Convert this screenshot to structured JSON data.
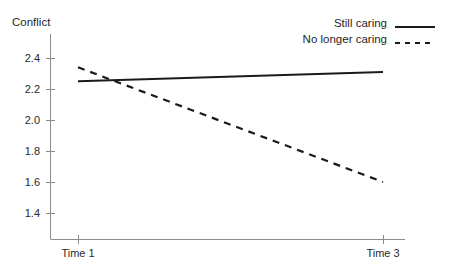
{
  "chart_data": {
    "type": "line",
    "title": "",
    "ylabel": "Conflict",
    "xlabel": "",
    "categories": [
      "Time 1",
      "Time 3"
    ],
    "x": [
      1,
      3
    ],
    "ylim": [
      1.3,
      2.48
    ],
    "xlim": [
      0.72,
      3.15
    ],
    "yticks": [
      "2.4",
      "2.2",
      "2.0",
      "1.8",
      "1.6",
      "1.4"
    ],
    "ytick_values": [
      2.4,
      2.2,
      2.0,
      1.8,
      1.6,
      1.4
    ],
    "xticks": [
      "Time 1",
      "Time 3"
    ],
    "grid": false,
    "legend_position": "top-right",
    "series": [
      {
        "name": "Still caring",
        "style": "solid",
        "color": "#1a1a1a",
        "values": [
          2.25,
          2.31
        ]
      },
      {
        "name": "No longer caring",
        "style": "dashed",
        "color": "#1a1a1a",
        "values": [
          2.34,
          1.6
        ]
      }
    ]
  },
  "axis": {
    "y_title": "Conflict",
    "axis_color": "#8c8c8c"
  },
  "legend": {
    "items": [
      {
        "label": "Still caring",
        "style": "solid"
      },
      {
        "label": "No longer caring",
        "style": "dashed"
      }
    ]
  }
}
